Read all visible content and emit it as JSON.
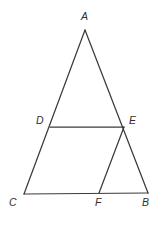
{
  "figure": {
    "kind": "geometry-diagram",
    "canvas": {
      "width": 161,
      "height": 226
    },
    "style": {
      "background_color": "#ffffff",
      "line_color": "#3b3b3b",
      "line_width": 1.25,
      "label_color": "#2f2f2f",
      "label_font_size": 10.5,
      "label_font_style": "italic"
    },
    "points": [
      {
        "id": "A",
        "label": "A",
        "x": 85,
        "y": 30,
        "label_x": 81,
        "label_y": 11
      },
      {
        "id": "B",
        "label": "B",
        "x": 148,
        "y": 193,
        "label_x": 142,
        "label_y": 197
      },
      {
        "id": "C",
        "label": "C",
        "x": 24,
        "y": 194,
        "label_x": 9,
        "label_y": 197
      },
      {
        "id": "D",
        "label": "D",
        "x": 50,
        "y": 127,
        "label_x": 36,
        "label_y": 115
      },
      {
        "id": "E",
        "label": "E",
        "x": 124,
        "y": 127,
        "label_x": 129,
        "label_y": 115
      },
      {
        "id": "F",
        "label": "F",
        "x": 99,
        "y": 193,
        "label_x": 95,
        "label_y": 197
      }
    ],
    "segments": [
      {
        "id": "AC",
        "from": "A",
        "to": "C",
        "name": "side-ac"
      },
      {
        "id": "AB",
        "from": "A",
        "to": "B",
        "name": "side-ab"
      },
      {
        "id": "CB",
        "from": "C",
        "to": "B",
        "name": "side-cb"
      },
      {
        "id": "DE",
        "from": "D",
        "to": "E",
        "name": "segment-de"
      },
      {
        "id": "FE",
        "from": "F",
        "to": "E",
        "name": "segment-fe"
      }
    ]
  }
}
